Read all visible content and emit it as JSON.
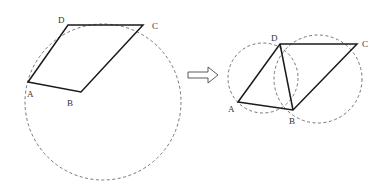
{
  "figure_left": {
    "labels": {
      "A": "A",
      "B": "B",
      "C": "C",
      "D": "D"
    },
    "points": {
      "A": [
        28,
        82
      ],
      "B": [
        81,
        92
      ],
      "C": [
        143,
        25
      ],
      "D": [
        68,
        25
      ]
    },
    "circle": {
      "cx": 103,
      "cy": 102,
      "r": 78
    }
  },
  "arrow": {
    "direction": "right"
  },
  "figure_right": {
    "labels": {
      "A": "A",
      "B": "B",
      "C": "C",
      "D": "D"
    },
    "points": {
      "A": [
        238,
        102
      ],
      "B": [
        293,
        110
      ],
      "C": [
        357,
        44
      ],
      "D": [
        280,
        44
      ]
    },
    "circles": [
      {
        "cx": 263,
        "cy": 78,
        "r": 35
      },
      {
        "cx": 318,
        "cy": 79,
        "r": 44
      }
    ],
    "diagonal": "DB"
  },
  "colors": {
    "line": "#1a1a1a",
    "dashed": "#666666"
  }
}
